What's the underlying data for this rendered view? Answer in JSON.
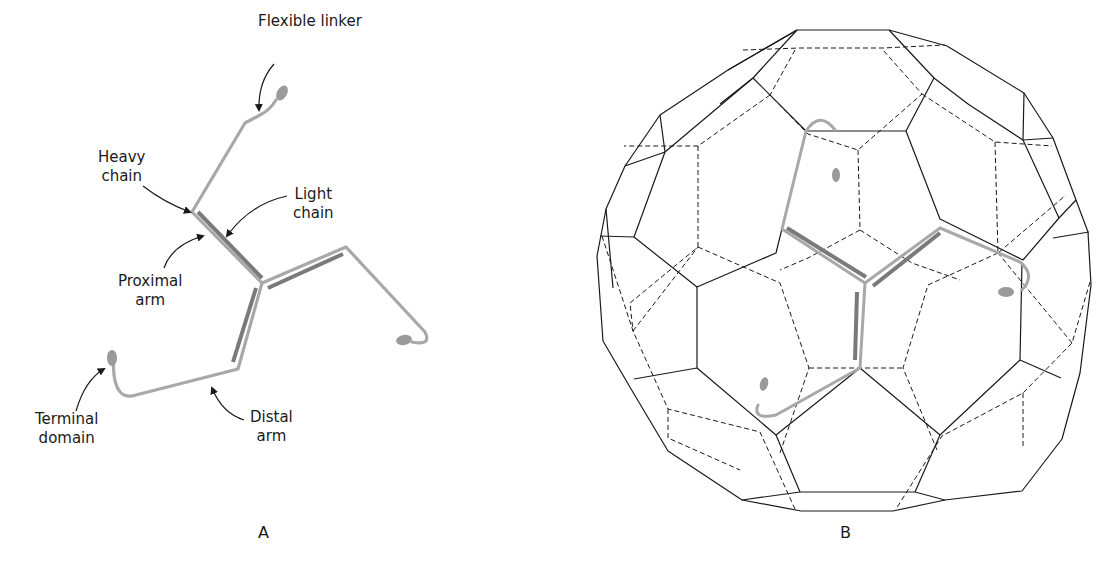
{
  "figure": {
    "colors": {
      "heavy_chain": "#a8a8a8",
      "light_chain": "#7a7a7a",
      "terminal_domain": "#9a9a9a",
      "edge_front": "#1a1a1a",
      "edge_back": "#1a1a1a",
      "text": "#1a1a1a"
    },
    "panel_a": {
      "letter": "A",
      "labels": {
        "flexible_linker": "Flexible linker",
        "heavy_chain": "Heavy\nchain",
        "light_chain": "Light\nchain",
        "proximal_arm": "Proximal\narm",
        "terminal_domain": "Terminal\ndomain",
        "distal_arm": "Distal\narm"
      }
    },
    "panel_b": {
      "letter": "B",
      "description": "Clathrin triskelion positioned on a truncated-icosahedron-like clathrin coat (front edges solid, back edges dashed)"
    }
  }
}
